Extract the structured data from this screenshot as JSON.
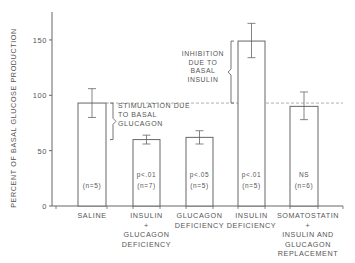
{
  "chart_data": {
    "type": "bar",
    "title": "",
    "xlabel": "",
    "ylabel": "PERCENT OF BASAL GLUCOSE PRODUCTION",
    "ylim": [
      0,
      175
    ],
    "yticks": [
      0,
      50,
      100,
      150
    ],
    "grid": false,
    "categories": [
      [
        "SALINE"
      ],
      [
        "INSULIN",
        "+",
        "GLUCAGON",
        "DEFICIENCY"
      ],
      [
        "GLUCAGON",
        "DEFICIENCY"
      ],
      [
        "INSULIN",
        "DEFICIENCY"
      ],
      [
        "SOMATOSTATIN",
        "+",
        "INSULIN  AND",
        "GLUCAGON",
        "REPLACEMENT"
      ]
    ],
    "values": [
      93,
      60,
      62,
      149,
      90
    ],
    "error_high": [
      106,
      64,
      68,
      165,
      103
    ],
    "error_low": [
      80,
      56,
      56,
      134,
      78
    ],
    "significance": [
      "",
      "p<.01",
      "p<.05",
      "p<.01",
      "NS"
    ],
    "n_labels": [
      "(n=5)",
      "(n=7)",
      "(n=5)",
      "(n=5)",
      "(n=6)"
    ],
    "reference_line": {
      "value": 93,
      "style": "dashed"
    },
    "annotations": [
      {
        "text": [
          "STIMULATION DUE",
          "TO BASAL",
          "GLUCAGON"
        ],
        "bracket_from": 60,
        "bracket_to": 93,
        "near_bar": 0
      },
      {
        "text": [
          "INHIBITION",
          "DUE TO",
          "BASAL",
          "INSULIN"
        ],
        "bracket_from": 93,
        "bracket_to": 149,
        "near_bar": 3
      }
    ]
  }
}
